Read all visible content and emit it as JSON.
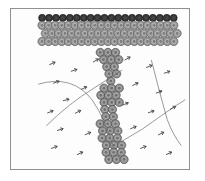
{
  "figure": {
    "background_color": "#ffffff",
    "frame": {
      "border_color": "#8f9195",
      "fill_color": "#fdfdfd",
      "x": 10,
      "y": 8,
      "width": 180,
      "height": 162
    }
  },
  "chart_data": {
    "type": "scatter",
    "title": "",
    "xlabel": "",
    "ylabel": "",
    "grid": false,
    "legend": "none",
    "xlim": [
      0,
      180
    ],
    "ylim": [
      0,
      162
    ]
  },
  "structure": {
    "band": {
      "name": "horizontal-cell-band",
      "x": 28,
      "y": 6,
      "width": 140,
      "height": 44,
      "dark_row": {
        "color": "#3b3b3b",
        "stroke": "#1f1f1f",
        "count": 20,
        "radius": 3.6,
        "y": 9
      },
      "gray_rows": {
        "color": "#9b9b9b",
        "stroke": "#555555",
        "inner_color": "#b8b8b8",
        "core_color": "#7d7d7d",
        "rows": 3,
        "per_row": 21,
        "radius": 4.2
      }
    },
    "stalk": {
      "name": "vertical-cell-stalk",
      "color": "#8f8f8f",
      "stroke": "#4d4d4d",
      "top_y": 44,
      "bottom_y": 154,
      "center_x": 98,
      "radius": 4.2,
      "description": "irregular descending column of circular cells widening near the base"
    }
  },
  "arcs": {
    "stroke_color": "#6d6d6d",
    "stroke_width": 0.7,
    "left_group": [
      "M 28 76 Q 62 66 82 92 Q 96 112 104 142",
      "M 36 118 Q 58 96 84 80 Q 100 70 112 62"
    ],
    "right_group": [
      "M 142 52 Q 150 84 158 112 Q 164 128 172 138",
      "M 112 134 Q 134 122 152 108 Q 166 98 176 92"
    ]
  },
  "markers": {
    "name": "arrow-tick-marks",
    "color": "#404040",
    "glyph": "arrow-dash",
    "positions": [
      {
        "x": 42,
        "y": 55,
        "rot": -24
      },
      {
        "x": 64,
        "y": 62,
        "rot": -18
      },
      {
        "x": 86,
        "y": 52,
        "rot": -30
      },
      {
        "x": 46,
        "y": 74,
        "rot": -20
      },
      {
        "x": 74,
        "y": 80,
        "rot": -26
      },
      {
        "x": 56,
        "y": 92,
        "rot": -15
      },
      {
        "x": 40,
        "y": 104,
        "rot": -22
      },
      {
        "x": 68,
        "y": 104,
        "rot": -28
      },
      {
        "x": 50,
        "y": 122,
        "rot": -18
      },
      {
        "x": 78,
        "y": 126,
        "rot": -24
      },
      {
        "x": 44,
        "y": 140,
        "rot": -20
      },
      {
        "x": 70,
        "y": 146,
        "rot": -26
      },
      {
        "x": 118,
        "y": 50,
        "rot": -30
      },
      {
        "x": 140,
        "y": 58,
        "rot": -22
      },
      {
        "x": 158,
        "y": 64,
        "rot": -18
      },
      {
        "x": 126,
        "y": 76,
        "rot": -26
      },
      {
        "x": 150,
        "y": 84,
        "rot": -20
      },
      {
        "x": 116,
        "y": 96,
        "rot": -24
      },
      {
        "x": 142,
        "y": 104,
        "rot": -18
      },
      {
        "x": 164,
        "y": 100,
        "rot": -28
      },
      {
        "x": 124,
        "y": 120,
        "rot": -22
      },
      {
        "x": 152,
        "y": 126,
        "rot": -26
      },
      {
        "x": 134,
        "y": 140,
        "rot": -20
      },
      {
        "x": 160,
        "y": 146,
        "rot": -24
      }
    ]
  }
}
